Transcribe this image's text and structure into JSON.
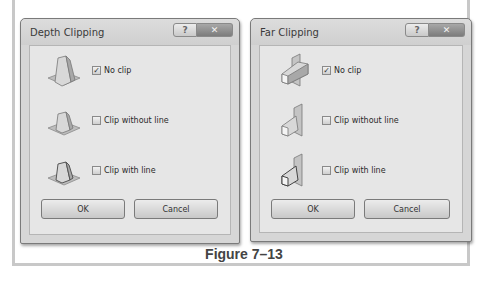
{
  "figure": {
    "caption": "Figure 7–13"
  },
  "dialogs": [
    {
      "title": "Depth Clipping",
      "help_label": "?",
      "close_label": "✕",
      "options": [
        {
          "label": "No clip",
          "checked": true,
          "check_glyph": "✓",
          "icon": "depth-no-clip-icon"
        },
        {
          "label": "Clip without line",
          "checked": false,
          "check_glyph": "",
          "icon": "depth-clip-without-line-icon"
        },
        {
          "label": "Clip with line",
          "checked": false,
          "check_glyph": "",
          "icon": "depth-clip-with-line-icon"
        }
      ],
      "ok_label": "OK",
      "cancel_label": "Cancel"
    },
    {
      "title": "Far Clipping",
      "help_label": "?",
      "close_label": "✕",
      "options": [
        {
          "label": "No clip",
          "checked": true,
          "check_glyph": "✓",
          "icon": "far-no-clip-icon"
        },
        {
          "label": "Clip without line",
          "checked": false,
          "check_glyph": "",
          "icon": "far-clip-without-line-icon"
        },
        {
          "label": "Clip with line",
          "checked": false,
          "check_glyph": "",
          "icon": "far-clip-with-line-icon"
        }
      ],
      "ok_label": "OK",
      "cancel_label": "Cancel"
    }
  ]
}
